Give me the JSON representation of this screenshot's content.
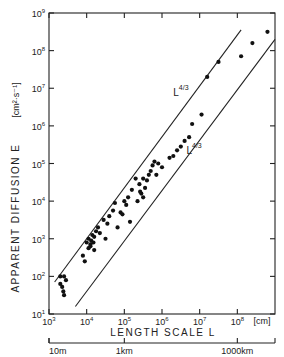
{
  "chart_data": {
    "type": "scatter",
    "title": "",
    "xlabel": "LENGTH SCALE L",
    "xunit": "[cm]",
    "ylabel": "APPARENT DIFFUSION E",
    "yunit": "[cm²·s⁻¹]",
    "xscale": "log",
    "yscale": "log",
    "xlim_exp": [
      3,
      9
    ],
    "ylim_exp": [
      1,
      9
    ],
    "x_ticks": [
      "10^3",
      "10^4",
      "10^5",
      "10^6",
      "10^7",
      "10^8"
    ],
    "y_ticks": [
      "10^1",
      "10^2",
      "10^3",
      "10^4",
      "10^5",
      "10^6",
      "10^7",
      "10^8",
      "10^9"
    ],
    "secondary_x_axis": {
      "labels": [
        "10m",
        "1km",
        "1000km"
      ],
      "positions_exp": [
        3,
        5,
        8
      ]
    },
    "reference_lines": [
      {
        "label": "L^4/3 (upper)",
        "slope": 1.3333,
        "log_start": [
          3.15,
          1.85
        ],
        "log_end": [
          8.1,
          8.55
        ]
      },
      {
        "label": "L^4/3 (lower)",
        "slope": 1.3333,
        "log_start": [
          3.7,
          1.2
        ],
        "log_end": [
          9.0,
          8.3
        ]
      }
    ],
    "annotations": [
      {
        "text": "L",
        "sup": "4/3",
        "log_pos": [
          6.3,
          6.8
        ]
      },
      {
        "text": "L",
        "sup": "4/3",
        "log_pos": [
          6.65,
          5.25
        ]
      }
    ],
    "series": [
      {
        "name": "observations",
        "points": [
          [
            3.3,
            2.0
          ],
          [
            3.4,
            2.0
          ],
          [
            3.45,
            1.9
          ],
          [
            3.3,
            1.8
          ],
          [
            3.38,
            1.6
          ],
          [
            3.4,
            1.5
          ],
          [
            3.35,
            1.72
          ],
          [
            3.9,
            2.55
          ],
          [
            3.95,
            2.4
          ],
          [
            4.0,
            2.9
          ],
          [
            4.05,
            3.0
          ],
          [
            4.1,
            2.85
          ],
          [
            4.12,
            2.95
          ],
          [
            4.15,
            3.1
          ],
          [
            4.2,
            3.05
          ],
          [
            4.18,
            2.9
          ],
          [
            4.25,
            3.2
          ],
          [
            4.3,
            3.3
          ],
          [
            4.35,
            3.15
          ],
          [
            4.2,
            2.7
          ],
          [
            4.1,
            2.8
          ],
          [
            4.05,
            2.75
          ],
          [
            4.45,
            3.5
          ],
          [
            4.55,
            3.4
          ],
          [
            4.6,
            3.6
          ],
          [
            4.5,
            3.0
          ],
          [
            4.7,
            3.75
          ],
          [
            4.75,
            3.95
          ],
          [
            4.82,
            3.3
          ],
          [
            4.9,
            3.7
          ],
          [
            5.0,
            4.0
          ],
          [
            5.05,
            3.9
          ],
          [
            5.1,
            4.1
          ],
          [
            4.95,
            3.65
          ],
          [
            5.15,
            3.45
          ],
          [
            5.2,
            4.3
          ],
          [
            5.3,
            4.6
          ],
          [
            5.4,
            4.45
          ],
          [
            5.45,
            4.2
          ],
          [
            5.5,
            4.1
          ],
          [
            5.55,
            4.35
          ],
          [
            5.6,
            4.55
          ],
          [
            5.5,
            4.6
          ],
          [
            5.35,
            4.0
          ],
          [
            5.42,
            4.25
          ],
          [
            5.65,
            4.7
          ],
          [
            5.7,
            4.8
          ],
          [
            5.75,
            4.95
          ],
          [
            5.8,
            5.05
          ],
          [
            5.9,
            5.0
          ],
          [
            5.85,
            4.7
          ],
          [
            6.0,
            4.9
          ],
          [
            6.3,
            5.2
          ],
          [
            6.4,
            5.35
          ],
          [
            6.5,
            5.45
          ],
          [
            6.6,
            5.6
          ],
          [
            6.72,
            5.7
          ],
          [
            6.2,
            5.15
          ],
          [
            6.8,
            6.05
          ],
          [
            7.05,
            6.3
          ],
          [
            7.2,
            7.3
          ],
          [
            7.5,
            7.7
          ],
          [
            8.1,
            7.85
          ],
          [
            8.4,
            8.2
          ],
          [
            8.8,
            8.5
          ]
        ]
      }
    ]
  }
}
